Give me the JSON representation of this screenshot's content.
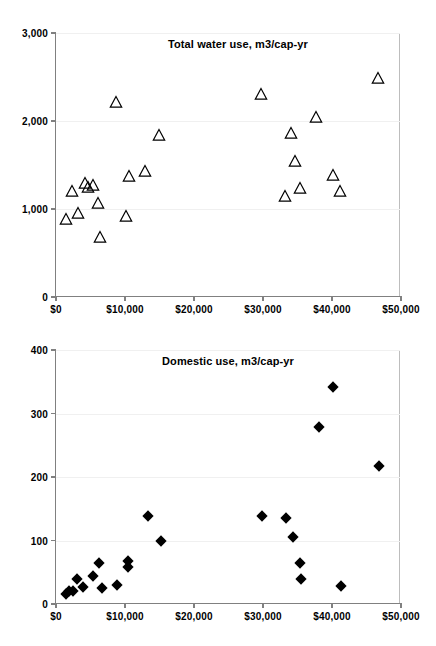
{
  "figure": {
    "background": "#ffffff",
    "axis_color": "#808080",
    "grid_color": "#f0f0f0",
    "marker_color": "#000000"
  },
  "chart_data": [
    {
      "id": "total-water-use",
      "type": "scatter",
      "title": "Total water use, m3/cap-yr",
      "xlabel": "",
      "ylabel": "",
      "xlim": [
        0,
        50000
      ],
      "ylim": [
        0,
        3000
      ],
      "grid": true,
      "legend": "none",
      "marker": "open-triangle",
      "xtick_labels": [
        "$0",
        "$10,000",
        "$20,000",
        "$30,000",
        "$40,000",
        "$50,000"
      ],
      "xtick_values": [
        0,
        10000,
        20000,
        30000,
        40000,
        50000
      ],
      "ytick_labels": [
        "0",
        "1,000",
        "2,000",
        "3,000"
      ],
      "ytick_values": [
        0,
        1000,
        2000,
        3000
      ],
      "points": [
        {
          "x": 1500,
          "y": 890
        },
        {
          "x": 2300,
          "y": 1200
        },
        {
          "x": 3200,
          "y": 960
        },
        {
          "x": 4200,
          "y": 1290
        },
        {
          "x": 4700,
          "y": 1250
        },
        {
          "x": 5400,
          "y": 1270
        },
        {
          "x": 6100,
          "y": 1070
        },
        {
          "x": 6400,
          "y": 680
        },
        {
          "x": 8700,
          "y": 2220
        },
        {
          "x": 10200,
          "y": 920
        },
        {
          "x": 10600,
          "y": 1370
        },
        {
          "x": 12900,
          "y": 1430
        },
        {
          "x": 14900,
          "y": 1840
        },
        {
          "x": 29700,
          "y": 2310
        },
        {
          "x": 33200,
          "y": 1150
        },
        {
          "x": 34000,
          "y": 1860
        },
        {
          "x": 34700,
          "y": 1550
        },
        {
          "x": 35300,
          "y": 1240
        },
        {
          "x": 37700,
          "y": 2040
        },
        {
          "x": 40100,
          "y": 1390
        },
        {
          "x": 41100,
          "y": 1210
        },
        {
          "x": 46600,
          "y": 2490
        }
      ]
    },
    {
      "id": "domestic-use",
      "type": "scatter",
      "title": "Domestic use, m3/cap-yr",
      "xlabel": "",
      "ylabel": "",
      "xlim": [
        0,
        50000
      ],
      "ylim": [
        0,
        400
      ],
      "grid": true,
      "legend": "none",
      "marker": "filled-diamond",
      "xtick_labels": [
        "$0",
        "$10,000",
        "$20,000",
        "$30,000",
        "$40,000",
        "$50,000"
      ],
      "xtick_values": [
        0,
        10000,
        20000,
        30000,
        40000,
        50000
      ],
      "ytick_labels": [
        "0",
        "100",
        "200",
        "300",
        "400"
      ],
      "ytick_values": [
        0,
        100,
        200,
        300,
        400
      ],
      "points": [
        {
          "x": 1500,
          "y": 16
        },
        {
          "x": 1900,
          "y": 21
        },
        {
          "x": 2400,
          "y": 20
        },
        {
          "x": 3000,
          "y": 39
        },
        {
          "x": 3900,
          "y": 27
        },
        {
          "x": 5400,
          "y": 44
        },
        {
          "x": 6200,
          "y": 65
        },
        {
          "x": 6700,
          "y": 25
        },
        {
          "x": 8800,
          "y": 30
        },
        {
          "x": 10400,
          "y": 58
        },
        {
          "x": 10500,
          "y": 68
        },
        {
          "x": 13400,
          "y": 139
        },
        {
          "x": 15200,
          "y": 100
        },
        {
          "x": 29900,
          "y": 139
        },
        {
          "x": 33300,
          "y": 136
        },
        {
          "x": 34300,
          "y": 105
        },
        {
          "x": 35400,
          "y": 65
        },
        {
          "x": 35500,
          "y": 39
        },
        {
          "x": 38100,
          "y": 279
        },
        {
          "x": 40200,
          "y": 341
        },
        {
          "x": 41300,
          "y": 28
        },
        {
          "x": 46800,
          "y": 217
        }
      ]
    }
  ]
}
